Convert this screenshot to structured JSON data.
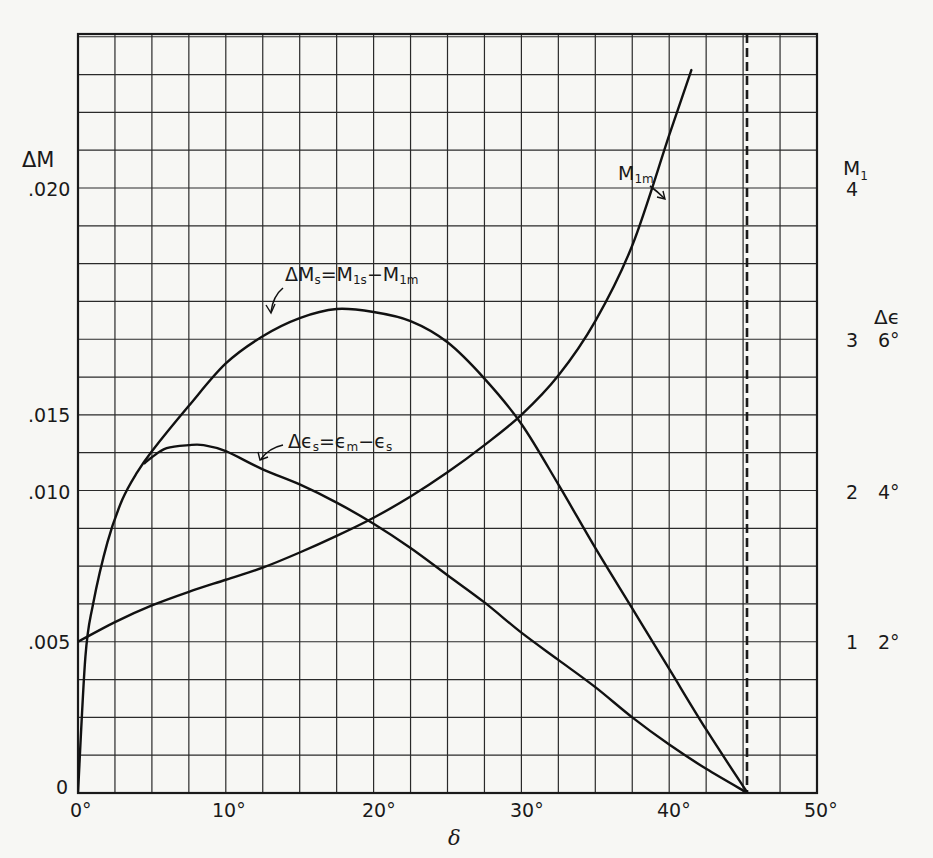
{
  "chart_data": {
    "type": "line",
    "title": "",
    "xlabel": "δ",
    "ylabel_left": "ΔM",
    "ylabel_right_1": "M1",
    "ylabel_right_2": "Δε",
    "xlim": [
      0,
      50
    ],
    "ylim_left": [
      0,
      0.024
    ],
    "ylim_right_M1": [
      0,
      4.8
    ],
    "ylim_right_deps": [
      0,
      9.6
    ],
    "grid": true,
    "grid_x_step_deg": 2.5,
    "grid_y_step": 0.00125,
    "x_ticks": [
      "0°",
      "10°",
      "20°",
      "30°",
      "40°",
      "50°"
    ],
    "y_ticks_left": [
      "0",
      ".005",
      ".010",
      ".015",
      ".020"
    ],
    "y_ticks_right_M1": [
      "1",
      "2",
      "3",
      "4"
    ],
    "y_ticks_right_deps": [
      "2°",
      "4°",
      "6°"
    ],
    "vertical_dashed_line_x": 45.3,
    "series": [
      {
        "name": "ΔMs = M1s − M1m",
        "axis": "left",
        "x": [
          0,
          0.5,
          1,
          2,
          3,
          4,
          5,
          7.5,
          10,
          12.5,
          15,
          17.5,
          20,
          22.5,
          25,
          27.5,
          30,
          32.5,
          35,
          37.5,
          40,
          42.5,
          45.3
        ],
        "y": [
          0,
          0.0045,
          0.0062,
          0.0083,
          0.0097,
          0.0106,
          0.0113,
          0.0128,
          0.0142,
          0.0151,
          0.0157,
          0.016,
          0.0159,
          0.0156,
          0.0149,
          0.0137,
          0.0122,
          0.0102,
          0.0081,
          0.0061,
          0.0041,
          0.0021,
          0
        ]
      },
      {
        "name": "Δεs = εm − εs",
        "axis": "right_deps",
        "x_note": "plotted on same grid; values read against left scale",
        "x": [
          4.5,
          5,
          6,
          7.5,
          8.5,
          10,
          12.5,
          15,
          17.5,
          20,
          22.5,
          25,
          27.5,
          30,
          32.5,
          35,
          37.5,
          40,
          42.5,
          45.3
        ],
        "y": [
          0.0109,
          0.0111,
          0.0114,
          0.0115,
          0.0115,
          0.0113,
          0.0107,
          0.0102,
          0.0096,
          0.0089,
          0.0081,
          0.0072,
          0.0063,
          0.0053,
          0.0044,
          0.0035,
          0.0025,
          0.0016,
          0.0008,
          0
        ]
      },
      {
        "name": "M1m",
        "axis": "right_M1",
        "x": [
          0,
          2.5,
          5,
          7.5,
          10,
          12.5,
          15,
          17.5,
          20,
          22.5,
          25,
          27.5,
          30,
          32.5,
          35,
          37.5,
          40,
          41.5
        ],
        "y": [
          1.0,
          1.13,
          1.24,
          1.33,
          1.41,
          1.49,
          1.59,
          1.7,
          1.82,
          1.96,
          2.12,
          2.3,
          2.5,
          2.76,
          3.12,
          3.62,
          4.35,
          4.78
        ]
      }
    ],
    "annotations": [
      {
        "text": "ΔMs=M1s−M1m",
        "near_x": 17.5,
        "near_y": 0.016
      },
      {
        "text": "Δεs=εm−εs",
        "near_x": 11,
        "near_y": 0.0112
      },
      {
        "text": "M1m",
        "near_x": 38.7,
        "near_y": 0.02
      }
    ]
  },
  "labels": {
    "y_left_title": "ΔM",
    "y_left_ticks": [
      ".020",
      ".015",
      ".010",
      ".005",
      "0"
    ],
    "y_right_M1_title": "M",
    "y_right_M1_sub": "1",
    "y_right_M1_ticks": [
      "4",
      "3",
      "2",
      "1"
    ],
    "y_right_deps_title": "Δϵ",
    "y_right_deps_ticks": [
      "6°",
      "4°",
      "2°"
    ],
    "x_ticks": [
      "0°",
      "10°",
      "20°",
      "30°",
      "40°",
      "50°"
    ],
    "x_title": "δ",
    "ann_dMs": {
      "a": "ΔM",
      "s1": "s",
      "eq": "=M",
      "s2": "1s",
      "minus": "−M",
      "s3": "1m"
    },
    "ann_deps": {
      "a": "Δϵ",
      "s1": "s",
      "eq": "=ϵ",
      "s2": "m",
      "minus": "−ϵ",
      "s3": "s"
    },
    "ann_M1m": {
      "a": "M",
      "s1": "1m"
    }
  }
}
